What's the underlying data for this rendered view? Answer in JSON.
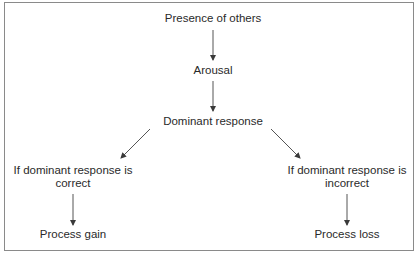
{
  "diagram": {
    "type": "flowchart",
    "nodes": {
      "presence": "Presence of others",
      "arousal": "Arousal",
      "dominant": "Dominant response",
      "correct_line1": "If dominant response is",
      "correct_line2": "correct",
      "incorrect_line1": "If dominant response is",
      "incorrect_line2": "incorrect",
      "gain": "Process gain",
      "loss": "Process loss"
    },
    "edges": [
      {
        "from": "Presence of others",
        "to": "Arousal"
      },
      {
        "from": "Arousal",
        "to": "Dominant response"
      },
      {
        "from": "Dominant response",
        "to": "If dominant response is correct"
      },
      {
        "from": "Dominant response",
        "to": "If dominant response is incorrect"
      },
      {
        "from": "If dominant response is correct",
        "to": "Process gain"
      },
      {
        "from": "If dominant response is incorrect",
        "to": "Process loss"
      }
    ],
    "colors": {
      "border": "#8a8a8a",
      "text": "#2a2a2a",
      "arrow": "#3a3a3a"
    }
  }
}
